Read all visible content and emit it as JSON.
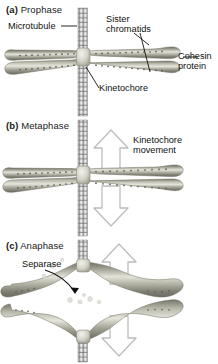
{
  "figure": {
    "background_color": "#ffffff",
    "chromatid_color": "#8d8d80",
    "chromatid_highlight": "#d8d8cf",
    "microtubule_color": "#9a9a9a",
    "arrow_outline_color": "#b0b0b0",
    "text_color": "#111111"
  },
  "panels": [
    {
      "key": "a",
      "letter": "(a)",
      "name": "Prophase",
      "labels": [
        {
          "id": "microtubule",
          "text": "Microtubule"
        },
        {
          "id": "sister-chromatids",
          "line1": "Sister",
          "line2": "chromatids"
        },
        {
          "id": "cohesin-protein",
          "line1": "Cohesin",
          "line2": "protein"
        },
        {
          "id": "kinetochore",
          "text": "Kinetochore"
        }
      ]
    },
    {
      "key": "b",
      "letter": "(b)",
      "name": "Metaphase",
      "labels": [
        {
          "id": "kinetochore-movement",
          "line1": "Kinetochore",
          "line2": "movement"
        }
      ],
      "arrows": [
        {
          "id": "arrow-up",
          "direction": "up"
        },
        {
          "id": "arrow-down",
          "direction": "down"
        }
      ]
    },
    {
      "key": "c",
      "letter": "(c)",
      "name": "Anaphase",
      "labels": [
        {
          "id": "separase",
          "text": "Separase"
        }
      ],
      "arrows": [
        {
          "id": "arrow-up",
          "direction": "up"
        },
        {
          "id": "arrow-down",
          "direction": "down"
        }
      ]
    }
  ]
}
